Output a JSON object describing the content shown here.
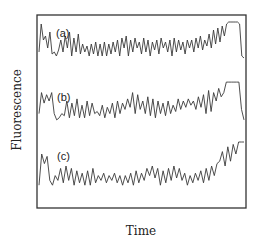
{
  "chart_data": {
    "type": "line",
    "title": "",
    "xlabel": "Time",
    "ylabel": "Fluorescence",
    "grid": false,
    "legend": "none",
    "axis_ticks": "none",
    "frame": {
      "left": 37,
      "top": 15,
      "right": 246,
      "bottom": 208
    },
    "x_range": [
      0,
      100
    ],
    "series": [
      {
        "name": "(a)",
        "baseline_y": 60,
        "amplitude": 40,
        "values": [
          0.2,
          0.9,
          0.5,
          0.6,
          0.3,
          0.7,
          0.15,
          0.2,
          0.1,
          0.25,
          0.5,
          0.2,
          0.6,
          0.3,
          0.7,
          0.1,
          0.55,
          0.2,
          0.65,
          0.15,
          0.4,
          0.2,
          0.35,
          0.1,
          0.4,
          0.15,
          0.45,
          0.1,
          0.4,
          0.1,
          0.45,
          0.1,
          0.4,
          0.15,
          0.45,
          0.2,
          0.5,
          0.1,
          0.55,
          0.3,
          0.6,
          0.1,
          0.5,
          0.2,
          0.55,
          0.3,
          0.45,
          0.15,
          0.55,
          0.2,
          0.5,
          0.1,
          0.45,
          0.25,
          0.5,
          0.15,
          0.55,
          0.3,
          0.45,
          0.2,
          0.5,
          0.1,
          0.55,
          0.2,
          0.5,
          0.25,
          0.45,
          0.15,
          0.5,
          0.3,
          0.5,
          0.2,
          0.55,
          0.3,
          0.6,
          0.25,
          0.5,
          0.35,
          0.65,
          0.3,
          0.75,
          0.4,
          0.8,
          0.45,
          0.85,
          0.6,
          0.9,
          0.95,
          0.95,
          0.95,
          0.95,
          0.95,
          0.9,
          0.1,
          0.05
        ]
      },
      {
        "name": "(b)",
        "baseline_y": 122,
        "amplitude": 42,
        "values": [
          0.2,
          0.7,
          0.45,
          0.65,
          0.5,
          0.7,
          0.2,
          0.05,
          0.1,
          0.2,
          0.15,
          0.5,
          0.1,
          0.45,
          0.15,
          0.55,
          0.1,
          0.4,
          0.1,
          0.5,
          0.15,
          0.45,
          0.2,
          0.25,
          0.15,
          0.4,
          0.1,
          0.35,
          0.2,
          0.45,
          0.1,
          0.5,
          0.2,
          0.45,
          0.3,
          0.55,
          0.35,
          0.7,
          0.2,
          0.65,
          0.3,
          0.5,
          0.2,
          0.6,
          0.15,
          0.55,
          0.1,
          0.5,
          0.2,
          0.45,
          0.15,
          0.5,
          0.2,
          0.4,
          0.25,
          0.55,
          0.3,
          0.5,
          0.35,
          0.55,
          0.4,
          0.5,
          0.3,
          0.6,
          0.35,
          0.65,
          0.2,
          0.75,
          0.25,
          0.7,
          0.5,
          0.8,
          0.6,
          0.7,
          0.95,
          0.95,
          0.95,
          0.95,
          0.95,
          0.95,
          0.3,
          0.05
        ]
      },
      {
        "name": "(c)",
        "baseline_y": 190,
        "amplitude": 48,
        "values": [
          0.1,
          0.75,
          0.55,
          0.7,
          0.2,
          0.1,
          0.3,
          0.2,
          0.45,
          0.15,
          0.5,
          0.2,
          0.45,
          0.1,
          0.4,
          0.15,
          0.35,
          0.1,
          0.4,
          0.1,
          0.45,
          0.15,
          0.3,
          0.2,
          0.35,
          0.15,
          0.3,
          0.2,
          0.35,
          0.15,
          0.3,
          0.1,
          0.3,
          0.15,
          0.35,
          0.1,
          0.4,
          0.15,
          0.35,
          0.2,
          0.45,
          0.3,
          0.5,
          0.25,
          0.45,
          0.1,
          0.4,
          0.15,
          0.45,
          0.2,
          0.5,
          0.25,
          0.45,
          0.2,
          0.35,
          0.1,
          0.3,
          0.15,
          0.35,
          0.2,
          0.4,
          0.15,
          0.45,
          0.2,
          0.5,
          0.3,
          0.55,
          0.6,
          0.8,
          0.5,
          0.9,
          0.6,
          0.95,
          0.75,
          1.0,
          1.0,
          1.0
        ]
      }
    ]
  }
}
